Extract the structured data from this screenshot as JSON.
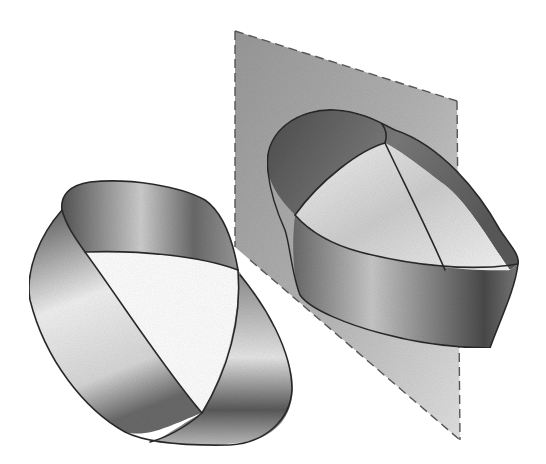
{
  "figure": {
    "title": "",
    "elements": [
      {
        "name": "left-mobius-strip",
        "label": ""
      },
      {
        "name": "mirror-plane",
        "label": ""
      },
      {
        "name": "right-mobius-strip",
        "label": ""
      }
    ]
  },
  "colors": {
    "background": "#ffffff",
    "plane_fill": "#a8a8a8",
    "strip_dark": "#4a4a4a",
    "strip_mid": "#8a8a8a",
    "strip_light": "#efefef",
    "outline": "#2a2a2a"
  }
}
